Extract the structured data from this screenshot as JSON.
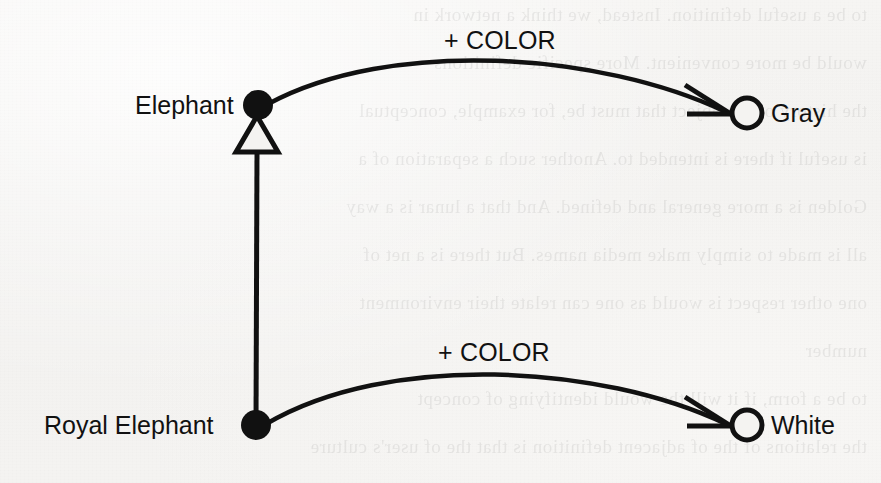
{
  "figure": {
    "kind": "semantic-network-diagram",
    "background_color": "#f4f3f1",
    "ink_color": "#111111",
    "width": 881,
    "height": 483
  },
  "nodes": [
    {
      "id": "elephant",
      "label": "Elephant",
      "marker": "filled-circle",
      "x": 258,
      "y": 105,
      "label_x": 135,
      "label_y": 93
    },
    {
      "id": "royal-elephant",
      "label": "Royal Elephant",
      "marker": "filled-circle",
      "x": 256,
      "y": 425,
      "label_x": 44,
      "label_y": 413
    },
    {
      "id": "gray",
      "label": "Gray",
      "marker": "hollow-circle",
      "x": 745,
      "y": 113,
      "label_x": 771,
      "label_y": 101
    },
    {
      "id": "white",
      "label": "White",
      "marker": "hollow-circle",
      "x": 745,
      "y": 425,
      "label_x": 771,
      "label_y": 413
    }
  ],
  "links": [
    {
      "id": "elephant-color-gray",
      "type": "role-arc",
      "from": "elephant",
      "to": "gray",
      "label": "+ COLOR",
      "label_x": 444,
      "label_y": 28,
      "arrowhead": "open-barbed"
    },
    {
      "id": "royal-elephant-color-white",
      "type": "role-arc",
      "from": "royal-elephant",
      "to": "white",
      "label": "+ COLOR",
      "label_x": 438,
      "label_y": 340,
      "arrowhead": "open-barbed"
    },
    {
      "id": "royal-elephant-isa-elephant",
      "type": "subsumption-link",
      "from": "royal-elephant",
      "to": "elephant",
      "label": "",
      "arrowhead": "hollow-triangle"
    }
  ],
  "bleed_through_lines": [
    "to be a useful definition. Instead, we think a network in",
    "would be more convenient. More specific definitions",
    "the history of the object that must be, for example, conceptual",
    "is useful if there is intended to. Another such a separation of a",
    "Golden is a more general and defined. And that a lunar is a way",
    "all is made to simply make media names. But there is a net of",
    "one other respect is would as one can relate their environment",
    "number",
    "to be a form, if it will the would identifying of concept",
    "the relations of the of adjacent definition is that the of user's culture"
  ]
}
